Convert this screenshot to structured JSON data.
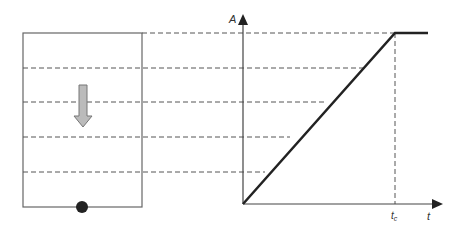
{
  "diagram": {
    "y_axis_label": "A",
    "x_axis_label": "t",
    "tc_label_main": "t",
    "tc_label_sub": "c",
    "colors": {
      "line": "#222222",
      "dash": "#555555",
      "arrow_fill": "#bbbbbb",
      "box": "#666666"
    },
    "levels": 5
  }
}
